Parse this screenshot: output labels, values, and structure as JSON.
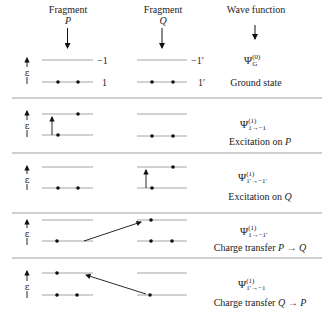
{
  "header": {
    "fragment_p_label": "Fragment",
    "fragment_p_symbol": "P",
    "fragment_q_label": "Fragment",
    "fragment_q_symbol": "Q",
    "wave_function_label": "Wave function"
  },
  "axis_label": "ε",
  "level_labels": {
    "p_upper": "−1",
    "p_lower": "1",
    "q_upper": "−1′",
    "q_lower": "1′"
  },
  "rows": [
    {
      "psi": "Ψ",
      "superscript": "(0)",
      "subscript": "G",
      "description": "Ground state"
    },
    {
      "psi": "Ψ",
      "superscript": "(1)",
      "subscript": "1→−1",
      "description_prefix": "Excitation on ",
      "description_symbol": "P"
    },
    {
      "psi": "Ψ",
      "superscript": "(1)",
      "subscript": "1′→−1′",
      "description_prefix": "Excitation on ",
      "description_symbol": "Q"
    },
    {
      "psi": "Ψ",
      "superscript": "(1)",
      "subscript": "1→−1′",
      "description_prefix": "Charge transfer ",
      "description_symbol": "P → Q"
    },
    {
      "psi": "Ψ",
      "superscript": "(1)",
      "subscript": "1′→−1",
      "description_prefix": "Charge transfer ",
      "description_symbol": "Q → P"
    }
  ],
  "colors": {
    "line": "#9a9a9a",
    "electron": "#111111",
    "separator": "#888888",
    "text": "#222222"
  }
}
